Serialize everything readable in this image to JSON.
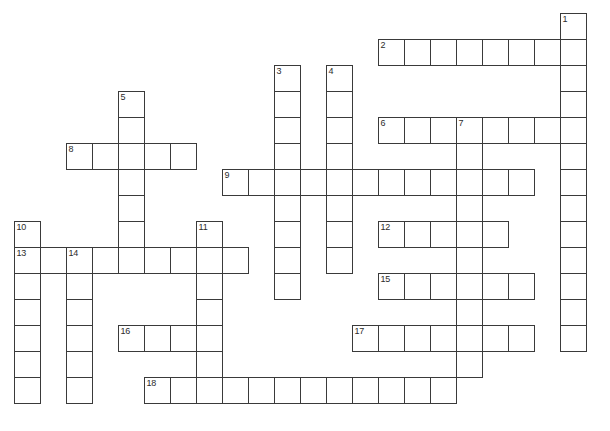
{
  "puzzle": {
    "type": "crossword-grid",
    "title": "",
    "cell_size": 26,
    "origin_x": 14,
    "origin_y": 13,
    "columns": 23,
    "rows": 16,
    "grid_line_color": "#3a3a3a",
    "cell_fill_color": "#ffffff",
    "background_color": "#ffffff",
    "number_color": "#2b2b2b",
    "entries": [
      {
        "number": "1",
        "direction": "down",
        "col": 21,
        "row": 0,
        "length": 13
      },
      {
        "number": "2",
        "direction": "across",
        "col": 14,
        "row": 1,
        "length": 8
      },
      {
        "number": "3",
        "direction": "down",
        "col": 10,
        "row": 2,
        "length": 9
      },
      {
        "number": "4",
        "direction": "down",
        "col": 12,
        "row": 2,
        "length": 8
      },
      {
        "number": "5",
        "direction": "down",
        "col": 4,
        "row": 3,
        "length": 6
      },
      {
        "number": "6",
        "direction": "across",
        "col": 14,
        "row": 4,
        "length": 8
      },
      {
        "number": "7",
        "direction": "down",
        "col": 17,
        "row": 4,
        "length": 10
      },
      {
        "number": "8",
        "direction": "across",
        "col": 2,
        "row": 5,
        "length": 5
      },
      {
        "number": "9",
        "direction": "across",
        "col": 8,
        "row": 6,
        "length": 12
      },
      {
        "number": "10",
        "direction": "down",
        "col": 0,
        "row": 8,
        "length": 7
      },
      {
        "number": "11",
        "direction": "down",
        "col": 7,
        "row": 8,
        "length": 7
      },
      {
        "number": "12",
        "direction": "across",
        "col": 14,
        "row": 8,
        "length": 5
      },
      {
        "number": "13",
        "direction": "across",
        "col": 0,
        "row": 9,
        "length": 9
      },
      {
        "number": "14",
        "direction": "down",
        "col": 2,
        "row": 9,
        "length": 6
      },
      {
        "number": "15",
        "direction": "across",
        "col": 14,
        "row": 10,
        "length": 6
      },
      {
        "number": "16",
        "direction": "across",
        "col": 4,
        "row": 12,
        "length": 3
      },
      {
        "number": "17",
        "direction": "across",
        "col": 13,
        "row": 12,
        "length": 7
      },
      {
        "number": "18",
        "direction": "across",
        "col": 5,
        "row": 14,
        "length": 12
      }
    ],
    "numbered_labels": [
      "1",
      "2",
      "3",
      "4",
      "5",
      "6",
      "7",
      "8",
      "9",
      "10",
      "11",
      "12",
      "13",
      "14",
      "15",
      "16",
      "17",
      "18"
    ]
  }
}
